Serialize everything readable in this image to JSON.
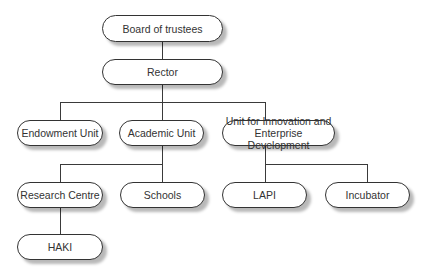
{
  "diagram": {
    "type": "org-chart",
    "nodes": {
      "board": "Board of trustees",
      "rector": "Rector",
      "endowment": "Endowment Unit",
      "academic": "Academic Unit",
      "uied_line1": "Unit for Innovation and",
      "uied_line2": "Enterprise Development",
      "research": "Research Centre",
      "schools": "Schools",
      "lapi": "LAPI",
      "incubator": "Incubator",
      "haki": "HAKI"
    },
    "edges": [
      [
        "Board of trustees",
        "Rector"
      ],
      [
        "Rector",
        "Endowment Unit"
      ],
      [
        "Rector",
        "Academic Unit"
      ],
      [
        "Rector",
        "Unit for Innovation and Enterprise Development"
      ],
      [
        "Academic Unit",
        "Research Centre"
      ],
      [
        "Academic Unit",
        "Schools"
      ],
      [
        "Unit for Innovation and Enterprise Development",
        "LAPI"
      ],
      [
        "Unit for Innovation and Enterprise Development",
        "Incubator"
      ],
      [
        "Research Centre",
        "HAKI"
      ]
    ]
  }
}
